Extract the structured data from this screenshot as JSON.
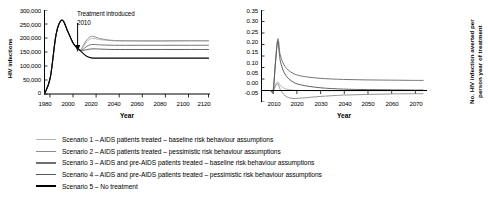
{
  "chart_data": [
    {
      "id": "left",
      "type": "line",
      "title": "",
      "xlabel": "Year",
      "ylabel": "HIV infections",
      "xlim": [
        1980,
        2120
      ],
      "ylim": [
        0,
        300000
      ],
      "xticks": [
        1980,
        2000,
        2020,
        2040,
        2060,
        2080,
        2100,
        2120
      ],
      "xtick_labels": [
        "1980",
        "2000",
        "2020",
        "2040",
        "2060",
        "2080",
        "2100",
        "2120"
      ],
      "yticks": [
        0,
        50000,
        100000,
        150000,
        200000,
        250000,
        300000
      ],
      "ytick_labels": [
        "0",
        "50,000",
        "100,000",
        "150,000",
        "200,000",
        "250,000",
        "300,000"
      ],
      "grid": false,
      "legend_position": "below-figure",
      "annotations": [
        {
          "text": "Treatment introduced",
          "x": 2013,
          "y": 292000
        },
        {
          "text": "2010",
          "x": 2013,
          "y": 265000
        },
        {
          "text": "arrow-down-to-2010",
          "x": 2010,
          "y": 175000
        }
      ],
      "series": [
        {
          "name": "Scenario 1",
          "color": "#b4b4b4",
          "x": [
            1980,
            1985,
            1990,
            1995,
            2000,
            2005,
            2010,
            2013,
            2016,
            2020,
            2025,
            2030,
            2040,
            2060,
            2080,
            2100,
            2120
          ],
          "values": [
            0,
            60000,
            215000,
            264000,
            222000,
            178000,
            157000,
            168000,
            186000,
            198000,
            196000,
            193000,
            190000,
            189000,
            189000,
            190000,
            190000
          ]
        },
        {
          "name": "Scenario 2",
          "color": "#8c8c8c",
          "x": [
            1980,
            1985,
            1990,
            1995,
            2000,
            2005,
            2010,
            2013,
            2016,
            2020,
            2025,
            2030,
            2040,
            2060,
            2080,
            2100,
            2120
          ],
          "values": [
            0,
            60000,
            215000,
            264000,
            222000,
            178000,
            157000,
            172000,
            193000,
            206000,
            201000,
            196000,
            191000,
            190000,
            190000,
            190000,
            190000
          ]
        },
        {
          "name": "Scenario 3",
          "color": "#6e6e6e",
          "x": [
            1980,
            1985,
            1990,
            1995,
            2000,
            2005,
            2010,
            2013,
            2016,
            2020,
            2025,
            2030,
            2040,
            2060,
            2080,
            2100,
            2120
          ],
          "values": [
            0,
            60000,
            215000,
            264000,
            222000,
            178000,
            157000,
            160000,
            170000,
            177000,
            176000,
            175000,
            174000,
            174000,
            174000,
            174000,
            174000
          ]
        },
        {
          "name": "Scenario 4",
          "color": "#5a5a5a",
          "x": [
            1980,
            1985,
            1990,
            1995,
            2000,
            2005,
            2010,
            2013,
            2016,
            2020,
            2025,
            2030,
            2040,
            2060,
            2080,
            2100,
            2120
          ],
          "values": [
            0,
            60000,
            215000,
            264000,
            222000,
            178000,
            157000,
            156000,
            158000,
            161000,
            161000,
            160000,
            159000,
            159000,
            159000,
            159000,
            159000
          ]
        },
        {
          "name": "Scenario 5",
          "color": "#000000",
          "x": [
            1980,
            1985,
            1990,
            1995,
            2000,
            2005,
            2010,
            2013,
            2016,
            2020,
            2025,
            2030,
            2040,
            2060,
            2080,
            2100,
            2120
          ],
          "values": [
            0,
            60000,
            215000,
            264000,
            222000,
            178000,
            157000,
            145000,
            135000,
            129000,
            128000,
            128000,
            128000,
            128000,
            128000,
            128000,
            128000
          ]
        }
      ]
    },
    {
      "id": "right",
      "type": "line",
      "title": "",
      "xlabel": "Year",
      "ylabel": "No. HIV infection averted per person year of treatment",
      "xlim": [
        2005,
        2075
      ],
      "ylim": [
        -0.05,
        0.35
      ],
      "xticks": [
        2010,
        2020,
        2030,
        2040,
        2050,
        2060,
        2070
      ],
      "xtick_labels": [
        "2010",
        "2020",
        "2030",
        "2040",
        "2050",
        "2060",
        "2070"
      ],
      "yticks": [
        -0.05,
        0.0,
        0.05,
        0.1,
        0.15,
        0.2,
        0.25,
        0.3,
        0.35
      ],
      "ytick_labels": [
        "-0.05",
        "0.00",
        "0.05",
        "0.10",
        "0.15",
        "0.20",
        "0.25",
        "0.30",
        "0.35"
      ],
      "grid": false,
      "legend_position": "below-figure",
      "series": [
        {
          "name": "Scenario 1",
          "color": "#b4b4b4",
          "x": [
            2009,
            2010,
            2011,
            2012,
            2013,
            2015,
            2018,
            2022,
            2030,
            2040,
            2050,
            2060,
            2070,
            2074
          ],
          "values": [
            0,
            0,
            0.025,
            0.038,
            0.022,
            0.008,
            0.002,
            0.0,
            -0.001,
            -0.001,
            -0.001,
            -0.001,
            -0.001,
            -0.001
          ]
        },
        {
          "name": "Scenario 2",
          "color": "#8c8c8c",
          "x": [
            2009,
            2010,
            2011,
            2012,
            2013,
            2015,
            2018,
            2022,
            2030,
            2040,
            2050,
            2060,
            2070,
            2074
          ],
          "values": [
            0,
            0,
            0.02,
            0.03,
            0.005,
            -0.022,
            -0.034,
            -0.033,
            -0.026,
            -0.02,
            -0.017,
            -0.015,
            -0.014,
            -0.014
          ]
        },
        {
          "name": "Scenario 3",
          "color": "#6e6e6e",
          "x": [
            2009,
            2010,
            2011,
            2012,
            2013,
            2015,
            2018,
            2022,
            2030,
            2040,
            2050,
            2060,
            2070,
            2074
          ],
          "values": [
            0,
            0,
            0.13,
            0.225,
            0.155,
            0.105,
            0.077,
            0.063,
            0.053,
            0.048,
            0.046,
            0.045,
            0.044,
            0.044
          ]
        },
        {
          "name": "Scenario 4",
          "color": "#5a5a5a",
          "x": [
            2009,
            2010,
            2011,
            2012,
            2013,
            2015,
            2018,
            2022,
            2030,
            2040,
            2050,
            2060,
            2070,
            2074
          ],
          "values": [
            0,
            0,
            0.125,
            0.215,
            0.13,
            0.072,
            0.04,
            0.024,
            0.012,
            0.006,
            0.004,
            0.003,
            0.002,
            0.002
          ]
        },
        {
          "name": "Scenario 5",
          "color": "#000000",
          "x": [
            2009,
            2010,
            2011,
            2012,
            2013,
            2015,
            2018,
            2022,
            2030,
            2040,
            2050,
            2060,
            2070,
            2074
          ],
          "values": [
            0,
            0,
            0,
            0,
            0,
            0,
            0,
            0,
            0,
            0,
            0,
            0,
            0,
            0
          ]
        }
      ]
    }
  ],
  "left_panel": {
    "ylabel": "HIV infections",
    "xlabel": "Year",
    "yticks": [
      "300,000",
      "250,000",
      "200,000",
      "150,000",
      "100,000",
      "50,000",
      "0"
    ],
    "xticks": [
      "1980",
      "2000",
      "2020",
      "2040",
      "2060",
      "2080",
      "2100",
      "2120"
    ],
    "annotation_line1": "Treatment introduced",
    "annotation_line2": "2010"
  },
  "right_panel": {
    "ylabel_line1": "No. HIV infection averted per",
    "ylabel_line2": "person year of treatment",
    "xlabel": "Year",
    "yticks": [
      "0.35",
      "0.30",
      "0.25",
      "0.20",
      "0.15",
      "0.10",
      "0.05",
      "0.00",
      "-0.05"
    ],
    "xticks": [
      "2010",
      "2020",
      "2030",
      "2040",
      "2050",
      "2060",
      "2070"
    ]
  },
  "legend": {
    "items": [
      {
        "label": "Scenario 1 – AIDS patients treated – baseline risk behaviour assumptions",
        "color": "#b4b4b4",
        "thickness": "1.3px"
      },
      {
        "label": "Scenario 2 – AIDS patients treated – pessimistic risk behaviour assumptions",
        "color": "#8c8c8c",
        "thickness": "1.7px"
      },
      {
        "label": "Scenario 3 – AIDS and pre-AIDS patients treated – baseline risk behaviour assumptions",
        "color": "#6e6e6e",
        "thickness": "1.9px"
      },
      {
        "label": "Scenario 4 – AIDS and pre-AIDS patients treated – pessimistic risk behaviour assumptions",
        "color": "#5a5a5a",
        "thickness": "1.5px"
      },
      {
        "label": "Scenario 5 – No treatment",
        "color": "#000000",
        "thickness": "2.1px"
      }
    ]
  }
}
